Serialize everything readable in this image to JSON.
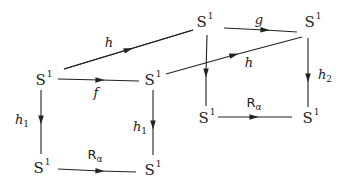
{
  "diagram": {
    "type": "commutative-diagram",
    "nodes": [
      {
        "id": "top_mid",
        "base": "S",
        "sup": "1",
        "x": 205,
        "y": 22
      },
      {
        "id": "top_right",
        "base": "S",
        "sup": "1",
        "x": 313,
        "y": 22
      },
      {
        "id": "mid_left",
        "base": "S",
        "sup": "1",
        "x": 40,
        "y": 77
      },
      {
        "id": "mid_center",
        "base": "S",
        "sup": "1",
        "x": 150,
        "y": 77
      },
      {
        "id": "low_mid",
        "base": "S",
        "sup": "1",
        "x": 207,
        "y": 118
      },
      {
        "id": "low_right",
        "base": "S",
        "sup": "1",
        "x": 313,
        "y": 118
      },
      {
        "id": "bot_left",
        "base": "S",
        "sup": "1",
        "x": 40,
        "y": 165
      },
      {
        "id": "bot_center",
        "base": "S",
        "sup": "1",
        "x": 150,
        "y": 165
      }
    ],
    "labels": {
      "h_top": {
        "base": "h",
        "sub": ""
      },
      "g": {
        "base": "g",
        "sub": ""
      },
      "f": {
        "base": "f",
        "sub": ""
      },
      "h_diag": {
        "base": "h",
        "sub": ""
      },
      "h1_left": {
        "base": "h",
        "sub": "1"
      },
      "h1_right": {
        "base": "h",
        "sub": "1"
      },
      "h2": {
        "base": "h",
        "sub": "2"
      },
      "R_bottom": {
        "base": "R",
        "sub": "α"
      },
      "R_right": {
        "base": "R",
        "sub": "α"
      }
    },
    "arrows": [
      {
        "from": "mid_left",
        "to": "top_mid",
        "label": "h"
      },
      {
        "from": "top_mid",
        "to": "top_right",
        "label": "g"
      },
      {
        "from": "mid_left",
        "to": "mid_center",
        "label": "f"
      },
      {
        "from": "mid_center",
        "to": "top_right",
        "label": "h"
      },
      {
        "from": "top_mid",
        "to": "low_mid",
        "label": ""
      },
      {
        "from": "top_right",
        "to": "low_right",
        "label": "h2"
      },
      {
        "from": "low_mid",
        "to": "low_right",
        "label": "Rα"
      },
      {
        "from": "mid_left",
        "to": "bot_left",
        "label": "h1"
      },
      {
        "from": "mid_center",
        "to": "bot_center",
        "label": "h1"
      },
      {
        "from": "bot_left",
        "to": "bot_center",
        "label": "Rα"
      }
    ],
    "colors": {
      "ink": "#222222",
      "background": "#ffffff"
    }
  }
}
